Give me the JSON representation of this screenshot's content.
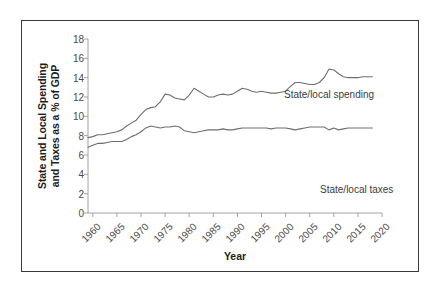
{
  "figure": {
    "y_axis_title_line1": "State and Local Spending",
    "y_axis_title_line2": "and Taxes as a % of GDP",
    "x_axis_title": "Year",
    "annotation_spending": "State/local spending",
    "annotation_taxes": "State/local taxes",
    "frame_color": "#3a3a3a",
    "axis_color": "#9a9a9a",
    "line_color": "#6e6e6e",
    "tick_label_color": "#4a4a4a"
  },
  "chart_data": {
    "type": "line",
    "title": "",
    "xlabel": "Year",
    "ylabel": "State and Local Spending and Taxes as a % of GDP",
    "xlim": [
      1959,
      2020
    ],
    "ylim": [
      0,
      18
    ],
    "yticks": [
      0,
      2,
      4,
      6,
      8,
      10,
      12,
      14,
      16,
      18
    ],
    "xticks": [
      1960,
      1965,
      1970,
      1975,
      1980,
      1985,
      1990,
      1995,
      2000,
      2005,
      2010,
      2015,
      2020
    ],
    "grid": false,
    "legend": "inline-annotations",
    "x": [
      1959,
      1960,
      1961,
      1962,
      1963,
      1964,
      1965,
      1966,
      1967,
      1968,
      1969,
      1970,
      1971,
      1972,
      1973,
      1974,
      1975,
      1976,
      1977,
      1978,
      1979,
      1980,
      1981,
      1982,
      1983,
      1984,
      1985,
      1986,
      1987,
      1988,
      1989,
      1990,
      1991,
      1992,
      1993,
      1994,
      1995,
      1996,
      1997,
      1998,
      1999,
      2000,
      2001,
      2002,
      2003,
      2004,
      2005,
      2006,
      2007,
      2008,
      2009,
      2010,
      2011,
      2012,
      2013,
      2014,
      2015,
      2016,
      2017,
      2018
    ],
    "series": [
      {
        "name": "State/local spending",
        "values": [
          7.8,
          7.9,
          8.1,
          8.1,
          8.2,
          8.3,
          8.4,
          8.6,
          9.0,
          9.3,
          9.6,
          10.2,
          10.7,
          10.9,
          11.0,
          11.5,
          12.3,
          12.2,
          11.9,
          11.8,
          11.7,
          12.2,
          12.9,
          12.6,
          12.3,
          12.0,
          12.0,
          12.2,
          12.3,
          12.2,
          12.3,
          12.6,
          12.9,
          12.8,
          12.6,
          12.5,
          12.6,
          12.5,
          12.4,
          12.4,
          12.5,
          12.6,
          13.1,
          13.5,
          13.5,
          13.4,
          13.3,
          13.3,
          13.5,
          14.0,
          14.9,
          14.8,
          14.4,
          14.1,
          14.0,
          14.0,
          14.0,
          14.1,
          14.1,
          14.1
        ]
      },
      {
        "name": "State/local taxes",
        "values": [
          6.8,
          7.0,
          7.2,
          7.2,
          7.3,
          7.4,
          7.4,
          7.4,
          7.6,
          7.9,
          8.1,
          8.4,
          8.8,
          9.0,
          8.9,
          8.8,
          8.9,
          8.9,
          9.0,
          8.9,
          8.5,
          8.4,
          8.3,
          8.4,
          8.5,
          8.6,
          8.6,
          8.6,
          8.7,
          8.6,
          8.6,
          8.7,
          8.8,
          8.8,
          8.8,
          8.8,
          8.8,
          8.8,
          8.7,
          8.8,
          8.8,
          8.8,
          8.7,
          8.6,
          8.7,
          8.8,
          8.9,
          8.9,
          8.9,
          8.9,
          8.6,
          8.8,
          8.6,
          8.7,
          8.8,
          8.8,
          8.8,
          8.8,
          8.8,
          8.8
        ]
      }
    ]
  }
}
